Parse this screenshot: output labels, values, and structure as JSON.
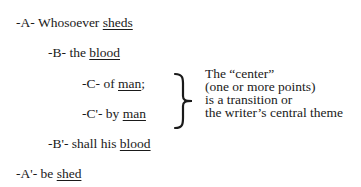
{
  "chiasm": [
    {
      "marker": "-A-",
      "text": "Whosoever",
      "underlined": "sheds",
      "suffix": ""
    },
    {
      "marker": "-B-",
      "text": "the",
      "underlined": "blood",
      "suffix": ""
    },
    {
      "marker": "-C-",
      "text": "of",
      "underlined": "man",
      "suffix": ";"
    },
    {
      "marker": "-C'-",
      "text": "by",
      "underlined": "man",
      "suffix": ""
    },
    {
      "marker": "-B'-",
      "text": "shall his",
      "underlined": "blood",
      "suffix": ""
    },
    {
      "marker": "-A'-",
      "text": "be",
      "underlined": "shed",
      "suffix": ""
    }
  ],
  "note": {
    "lines": [
      "The “center”",
      "(one or more points)",
      "is a transition or",
      "the writer’s central theme"
    ]
  }
}
